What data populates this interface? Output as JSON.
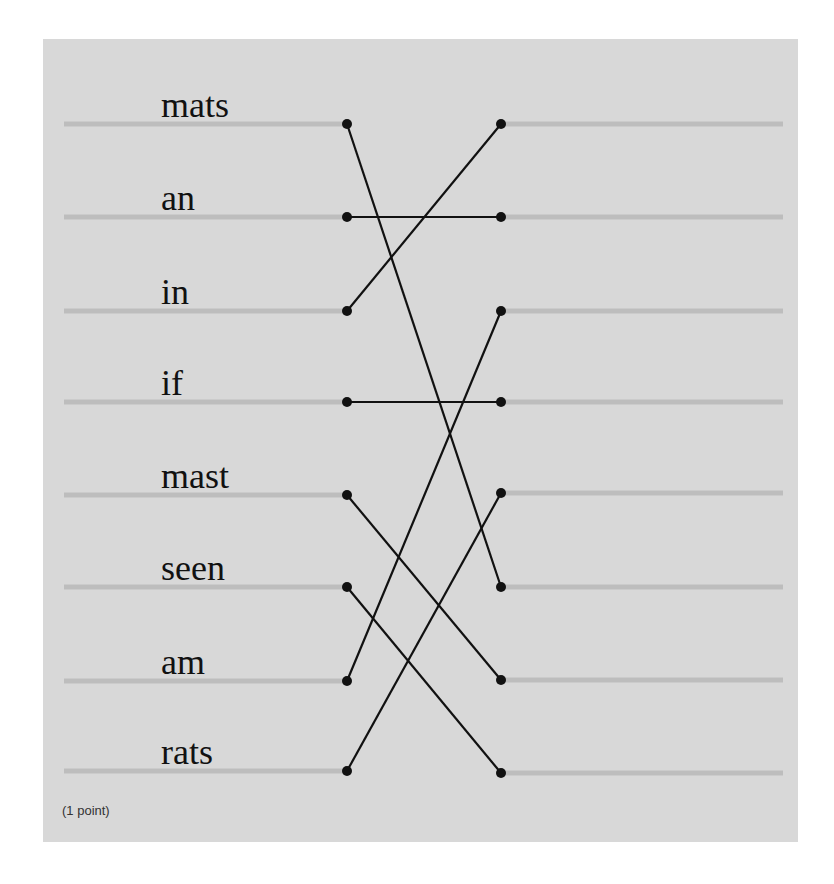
{
  "exercise": {
    "points_label": "(1 point)",
    "left_words": [
      "mats",
      "an",
      "in",
      "if",
      "mast",
      "seen",
      "am",
      "rats"
    ],
    "left_rows_y": [
      124,
      217,
      311,
      402,
      495,
      587,
      681,
      771
    ],
    "right_rows_y": [
      124,
      217,
      311,
      402,
      493,
      587,
      680,
      773
    ],
    "connections": [
      {
        "from": 0,
        "to": 5
      },
      {
        "from": 1,
        "to": 1
      },
      {
        "from": 2,
        "to": 0
      },
      {
        "from": 3,
        "to": 3
      },
      {
        "from": 4,
        "to": 6
      },
      {
        "from": 5,
        "to": 7
      },
      {
        "from": 6,
        "to": 2
      },
      {
        "from": 7,
        "to": 4
      }
    ],
    "colors": {
      "panel_bg": "#d8d8d8",
      "track_line": "#bdbdbd",
      "connector": "#111111"
    }
  }
}
